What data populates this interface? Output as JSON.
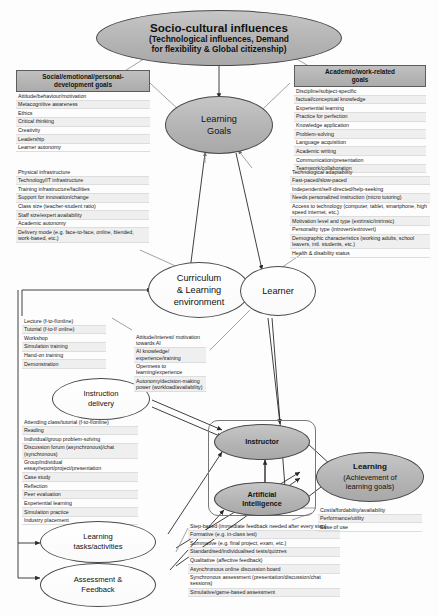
{
  "diagram": {
    "nodes": {
      "socio_cultural": {
        "line1": "Socio-cultural influences",
        "line2": "(Technological influences, Demand",
        "line3": "for flexibility & Global citizenship)"
      },
      "learning_goals": {
        "line1": "Learning",
        "line2": "Goals"
      },
      "curriculum": {
        "line1": "Curriculum",
        "line2": "& Learning",
        "line3": "environment"
      },
      "learner": {
        "label": "Learner"
      },
      "instruction_delivery": {
        "line1": "Instruction",
        "line2": "delivery"
      },
      "learning_tasks": {
        "line1": "Learning",
        "line2": "tasks/activities"
      },
      "assessment_feedback": {
        "line1": "Assessment &",
        "line2": "Feedback"
      },
      "instructor": {
        "label": "Instructor"
      },
      "artificial_intelligence": {
        "line1": "Artificial",
        "line2": "Intelligence"
      },
      "learning_outcome": {
        "title": "Learning",
        "line2": "(Achievement of",
        "line3": "learning goals)"
      }
    },
    "panels": {
      "social_goals": {
        "title": "Social/emotional/personal-development goals",
        "title_line1": "Social/emotional/personal-",
        "title_line2": "development goals",
        "items": [
          "Attitude/behaviour/motivation",
          "Metacognitive awareness",
          "Ethics",
          "Critical thinking",
          "Creativity",
          "Leadership",
          "Learner autonomy"
        ]
      },
      "academic_goals": {
        "title": "Academic/work-related goals",
        "title_line1": "Academic/work-related",
        "title_line2": "goals",
        "items": [
          "Discipline/subject-specific",
          "factual/conceptual knowledge",
          "Experiential learning",
          "Practice for perfection",
          "Knowledge application",
          "Problem-solving",
          "Language acquisition",
          "Academic writing",
          "Communication/presentation",
          "Teamwork/collaboration"
        ]
      },
      "institution_factors": {
        "items": [
          "Physical infrastructure",
          "Technology/IT infrastructure",
          "Training infrastructure/facilities",
          "Support for innovation/change",
          "Class size (teacher-student ratio)",
          "Staff size/expert availability",
          "Academic autonomy",
          "Delivery mode (e.g. face-to-face, online, blended, work-based, etc.)"
        ]
      },
      "learner_factors": {
        "items": [
          "Technological adaptability",
          "Fast-paced/slow-paced",
          "Independent/self-directed/help-seeking",
          "Needs personalized instruction (micro tutoring)",
          "Access to technology (computer, tablet, smartphone, high speed internet, etc.)",
          "Motivation level and type (extrinsic/intrinsic)",
          "Personality type (introvert/extrovert)",
          "Demographic characteristics (working adults, school leavers, intl. students, etc.)",
          "Health & disability status"
        ]
      },
      "delivery_modes": {
        "items": [
          "Lecture (f-to-f/online)",
          "Tutorial (f-to-f/ online)",
          "Workshop",
          "Simulation training",
          "Hand-on training",
          "Demonstration"
        ]
      },
      "attitude_towards_ai": {
        "items": [
          "Attitude/interest/ motivation towards AI",
          "AI knowledge/ experience/training",
          "Openness to learning/experience",
          "Autonomy/decision-making power (workload/availability)"
        ]
      },
      "task_types": {
        "items": [
          "Attending class/tutorial (f-to-f/online)",
          "Reading",
          "Individual/group problem-solving",
          "Discussion forum (asynchronous)/chat (synchronous)",
          "Group/individual essay/report/project/presentation",
          "Case study",
          "Reflection",
          "Peer evaluation",
          "Experiential learning",
          "Simulation practice",
          "Industry placement"
        ]
      },
      "assessment_types": {
        "items": [
          "Step-based (immediate feedback needed after every step)",
          "Formative (e.g. in-class test)",
          "Summative (e.g. final project, exam, etc.)",
          "Standardised/individualised tests/quizzes",
          "Qualitative (affective feedback)",
          "Asynchronous online discussion board",
          "Synchronous assessment (presentation/discussion/chat sessions)",
          "Simulative/game-based assessment"
        ]
      },
      "ai_criteria": {
        "items": [
          "Cost/affordability/availability",
          "Performance/utility",
          "Ease of use"
        ]
      }
    },
    "colors": {
      "node_fill_grey": "#b9b9b9",
      "node_fill_white": "#ffffff",
      "panel_header": "#b5b5b5",
      "row_alt": "#eeeeee",
      "line": "#4a4a4a"
    }
  }
}
